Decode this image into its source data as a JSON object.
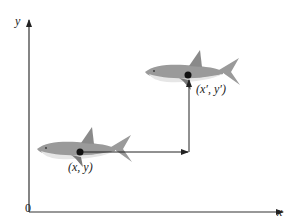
{
  "axes": {
    "x_label": "x",
    "y_label": "y",
    "origin_label": "0",
    "axis_color": "#333333"
  },
  "points": {
    "start_label": "(x, y)",
    "end_label": "(x′, y′)"
  },
  "shark": {
    "body_color": "#9a9a9a",
    "belly_color": "#e6e6e6",
    "fin_color": "#8a8a8a",
    "dot_color": "#111111"
  },
  "translation_arrow": {
    "color": "#222222",
    "segments": [
      "horizontal",
      "vertical"
    ]
  }
}
